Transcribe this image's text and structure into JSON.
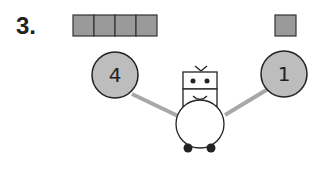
{
  "problem": {
    "number": "3.",
    "left_blocks": 4,
    "right_blocks": 1,
    "left_circle_value": "4",
    "right_circle_value": "1"
  },
  "colors": {
    "block_fill": "#9a9a9a",
    "circle_fill": "#bdbdbd",
    "arm_color": "#a8a8a8",
    "outline": "#222222"
  }
}
